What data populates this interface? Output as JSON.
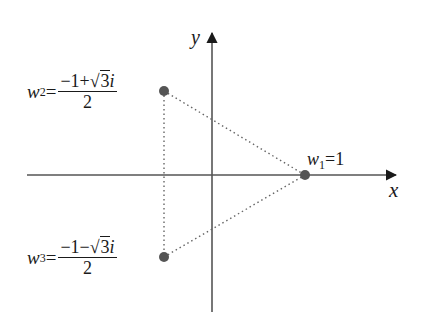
{
  "diagram": {
    "axes": {
      "x_label": "x",
      "y_label": "y",
      "color": "#555555"
    },
    "points": [
      {
        "id": "w1",
        "name": "w",
        "subscript": "1",
        "equals": "=",
        "value": "1",
        "px": 305,
        "py": 175
      },
      {
        "id": "w2",
        "name": "w",
        "subscript": "2",
        "equals": "=",
        "numerator_pre": "−1+",
        "sqrt_arg": "3",
        "numerator_post": "i",
        "denominator": "2",
        "px": 164,
        "py": 91
      },
      {
        "id": "w3",
        "name": "w",
        "subscript": "3",
        "equals": "=",
        "numerator_pre": "−1−",
        "sqrt_arg": "3",
        "numerator_post": "i",
        "denominator": "2",
        "px": 164,
        "py": 257
      }
    ],
    "point_color": "#555555",
    "triangle_edges": "dotted",
    "sqrt_symbol": "√"
  }
}
